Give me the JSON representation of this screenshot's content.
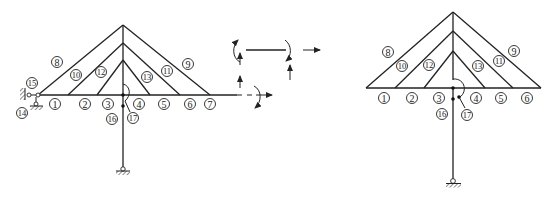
{
  "figure": {
    "left_structure": {
      "member_labels": [
        {
          "id": "1",
          "x": 55,
          "y": 104
        },
        {
          "id": "2",
          "x": 85,
          "y": 104
        },
        {
          "id": "3",
          "x": 108,
          "y": 104
        },
        {
          "id": "4",
          "x": 139,
          "y": 104
        },
        {
          "id": "5",
          "x": 164,
          "y": 104
        },
        {
          "id": "6",
          "x": 190,
          "y": 104
        },
        {
          "id": "7",
          "x": 210,
          "y": 104
        },
        {
          "id": "8",
          "x": 57,
          "y": 62
        },
        {
          "id": "9",
          "x": 188,
          "y": 64
        },
        {
          "id": "10",
          "x": 76,
          "y": 75
        },
        {
          "id": "11",
          "x": 167,
          "y": 71
        },
        {
          "id": "12",
          "x": 101,
          "y": 72
        },
        {
          "id": "13",
          "x": 147,
          "y": 77
        },
        {
          "id": "14",
          "x": 22,
          "y": 113
        },
        {
          "id": "15",
          "x": 32,
          "y": 83
        },
        {
          "id": "16",
          "x": 112,
          "y": 119
        },
        {
          "id": "17",
          "x": 133,
          "y": 118
        }
      ]
    },
    "free_body": {
      "description": "joint forces and moments diagram"
    },
    "right_structure": {
      "member_labels": [
        {
          "id": "1",
          "x": 384,
          "y": 98
        },
        {
          "id": "2",
          "x": 412,
          "y": 98
        },
        {
          "id": "3",
          "x": 439,
          "y": 98
        },
        {
          "id": "4",
          "x": 476,
          "y": 98
        },
        {
          "id": "5",
          "x": 501,
          "y": 98
        },
        {
          "id": "6",
          "x": 527,
          "y": 98
        },
        {
          "id": "8",
          "x": 388,
          "y": 52
        },
        {
          "id": "9",
          "x": 514,
          "y": 51
        },
        {
          "id": "10",
          "x": 402,
          "y": 66
        },
        {
          "id": "11",
          "x": 499,
          "y": 61
        },
        {
          "id": "12",
          "x": 429,
          "y": 65
        },
        {
          "id": "13",
          "x": 478,
          "y": 66
        },
        {
          "id": "16",
          "x": 442,
          "y": 114
        },
        {
          "id": "17",
          "x": 467,
          "y": 115
        }
      ]
    }
  }
}
